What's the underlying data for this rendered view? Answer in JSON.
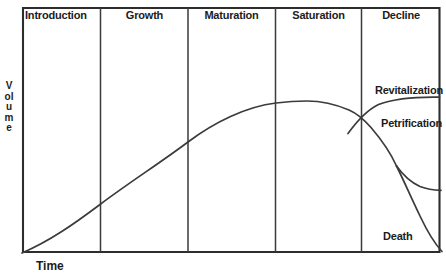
{
  "diagram": {
    "axes": {
      "y_label": "Volume",
      "x_label": "Time"
    },
    "phases": [
      {
        "label": "Introduction"
      },
      {
        "label": "Growth"
      },
      {
        "label": "Maturation"
      },
      {
        "label": "Saturation"
      },
      {
        "label": "Decline"
      }
    ],
    "branch_labels": {
      "revitalization": "Revitalization",
      "petrification": "Petrification",
      "death": "Death"
    },
    "colors": {
      "background": "#ffffff",
      "frame": "#2d2d2d",
      "divider": "#3b3b3b",
      "curve": "#3b3b3b",
      "text": "#1c1c1c"
    },
    "geometry": {
      "frame": "M 23 8 L 439.5 8 L 439.5 252 L 23 252 Z",
      "dividers": "M 100.5 8 V 252 M 188 8 V 252 M 275.5 8 V 252 M 361.5 8 V 252",
      "main_curve": "M 22 253 C 50 241 74 224 100 204.5 C 130 182 160 163 188 142 C 214 122.5 246 106.5 276 103 C 288 101.5 298 101 307 101 C 320 101 336 104.5 349 110 C 357 113.5 364 119.5 371 127.5 C 380 138 390 151.5 396.5 166",
      "death_curve": "M 396.5 166 C 403 179 411 197 420 216 C 428 233 435.5 244.5 442 251.5",
      "petrification_curve": "M 396.5 166 C 403 175 411 182.5 420 186.5 C 427 189.3 434 190.2 441 190.3",
      "revitalization_curve": "M 348 133.5 C 356 122.5 366 110.5 378.5 104.5 C 394 98.8 418 96.8 439.5 97.2"
    }
  },
  "chart_data": {
    "type": "line",
    "xlabel": "Time",
    "ylabel": "Volume",
    "grid": false,
    "phases": [
      "Introduction",
      "Growth",
      "Maturation",
      "Saturation",
      "Decline"
    ],
    "series": [
      {
        "name": "lifecycle-curve",
        "description": "Volume rises from zero at start of Introduction, climbs steadily through Growth, flattens and peaks in Saturation, then declines entering the Decline phase"
      },
      {
        "name": "Revitalization",
        "description": "Upper branch in Decline phase: splits from the declining curve and rises, flattening near the peak level"
      },
      {
        "name": "Petrification",
        "description": "Middle branch in Decline phase: decline levels off to a steady lower volume"
      },
      {
        "name": "Death",
        "description": "Lower branch in Decline phase: volume falls continuously to zero at far right"
      }
    ]
  }
}
